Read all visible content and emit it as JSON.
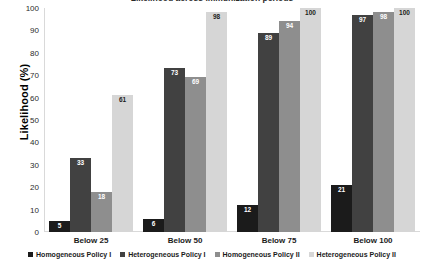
{
  "chart_data": {
    "type": "bar",
    "title": "Likelihood across immunization periods",
    "xlabel": "",
    "ylabel": "Likelihood (%)",
    "ylim": [
      0,
      100
    ],
    "ytick_step": 10,
    "yticks": [
      100,
      90,
      80,
      70,
      60,
      50,
      40,
      30,
      20,
      10,
      0
    ],
    "grid": false,
    "legend_position": "bottom",
    "categories": [
      "Below 25",
      "Below 50",
      "Below 75",
      "Below 100"
    ],
    "series": [
      {
        "name": "Homogeneous Policy I",
        "color": "#1b1b1b",
        "values": [
          5,
          6,
          12,
          21
        ]
      },
      {
        "name": "Heterogeneous Policy I",
        "color": "#414141",
        "values": [
          33,
          73,
          89,
          97
        ]
      },
      {
        "name": "Homogeneous Policy II",
        "color": "#8e8e8e",
        "values": [
          18,
          69,
          94,
          98
        ]
      },
      {
        "name": "Heterogeneous Policy II",
        "color": "#d6d6d6",
        "values": [
          61,
          98,
          100,
          100
        ]
      }
    ]
  }
}
